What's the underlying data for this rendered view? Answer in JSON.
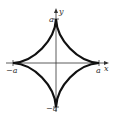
{
  "figure": {
    "axes": {
      "x_label": "x",
      "y_label": "y"
    },
    "ticks": {
      "top": "a",
      "bottom": "−a",
      "left": "−a",
      "right": "a"
    },
    "colors": {
      "curve": "#111111",
      "axes": "#333333",
      "background": "#ffffff"
    }
  }
}
